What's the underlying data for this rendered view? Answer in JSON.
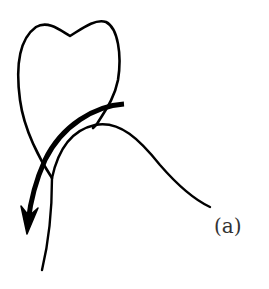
{
  "figure": {
    "label": "(a)",
    "elements": {
      "tooth": "tooth-crown-outline",
      "gum": "gingival-contour",
      "arrow": "directional-arrow-downward"
    },
    "colors": {
      "stroke": "#000000",
      "background": "#ffffff",
      "label": "#333333"
    }
  }
}
